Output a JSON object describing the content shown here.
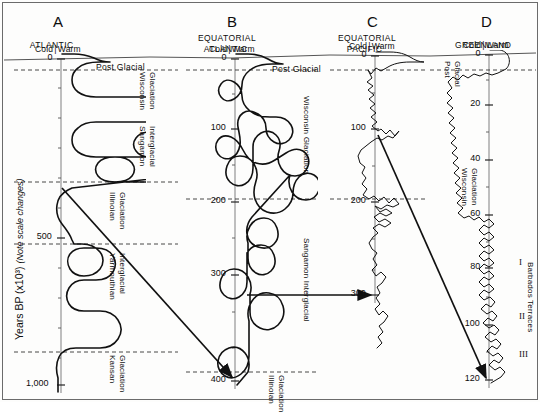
{
  "figure": {
    "y_axis_label_main": "Years BP (x10³)",
    "y_axis_label_note": "(Note scale changes)",
    "cold": "Cold",
    "warm": "Warm",
    "post_glacial": "Post Glacial"
  },
  "panels": [
    {
      "letter": "A",
      "title_lines": [
        "ATLANTIC"
      ],
      "axis_x": 61,
      "ticks": [
        {
          "label": "0",
          "y": 59
        },
        {
          "label": "500",
          "y": 238
        },
        {
          "label": "1,000",
          "y": 385
        }
      ],
      "minor_ticks": [
        88,
        118,
        148,
        178,
        208,
        268,
        298,
        328,
        358
      ],
      "stages": [
        {
          "label_lines": [
            "Wisconsin",
            "Glaciation"
          ],
          "x": 146,
          "y": 72
        },
        {
          "label_lines": [
            "Sangamon",
            "Interglacial"
          ],
          "x": 146,
          "y": 126
        },
        {
          "label_lines": [
            "Illinoian",
            "Glaciation"
          ],
          "x": 116,
          "y": 192
        },
        {
          "label_lines": [
            "Yarmouthian",
            "Interglacial"
          ],
          "x": 116,
          "y": 253
        },
        {
          "label_lines": [
            "Kansan",
            "Glaciation"
          ],
          "x": 116,
          "y": 355
        }
      ],
      "boundaries_y": [
        70,
        182,
        244,
        352
      ]
    },
    {
      "letter": "B",
      "title_lines": [
        "EQUATORIAL",
        "ATLANTIC"
      ],
      "axis_x": 235,
      "ticks": [
        {
          "label": "0",
          "y": 59
        },
        {
          "label": "100",
          "y": 129
        },
        {
          "label": "200",
          "y": 202
        },
        {
          "label": "300",
          "y": 275
        },
        {
          "label": "400",
          "y": 381
        }
      ],
      "minor_ticks": [
        94,
        165,
        238,
        312,
        348
      ],
      "stages": [
        {
          "label_lines": [
            "Wisconsin Glaciation"
          ],
          "x": 310,
          "y": 96
        },
        {
          "label_lines": [
            "Sangamon Interglacial"
          ],
          "x": 310,
          "y": 238
        },
        {
          "label_lines": [
            "Illinoian",
            "Glaciation"
          ],
          "x": 275,
          "y": 375
        }
      ],
      "boundaries_y": [
        70,
        199,
        372
      ]
    },
    {
      "letter": "C",
      "title_lines": [
        "EQUATORIAL",
        "PACIFIC"
      ],
      "axis_x": 375,
      "ticks": [
        {
          "label": "0",
          "y": 56
        },
        {
          "label": "100",
          "y": 129
        },
        {
          "label": "200",
          "y": 202
        },
        {
          "label": "300",
          "y": 295
        }
      ],
      "minor_ticks": [
        93,
        166,
        239,
        270
      ],
      "stages": [],
      "boundaries_y": [
        70,
        199
      ]
    },
    {
      "letter": "D",
      "title_lines": [
        "GREENLAND"
      ],
      "axis_x": 489,
      "ticks": [
        {
          "label": "0",
          "y": 55
        },
        {
          "label": "20",
          "y": 105
        },
        {
          "label": "40",
          "y": 160
        },
        {
          "label": "60",
          "y": 215
        },
        {
          "label": "80",
          "y": 268
        },
        {
          "label": "100",
          "y": 325
        },
        {
          "label": "120",
          "y": 380
        }
      ],
      "minor_ticks": [
        80,
        132,
        187,
        242,
        297,
        352
      ],
      "stages": [
        {
          "label_lines": [
            "Post",
            "Glacial"
          ],
          "x": 451,
          "y": 61
        },
        {
          "label_lines": [
            "Wisconsin",
            "Glaciation"
          ],
          "x": 468,
          "y": 168
        }
      ],
      "boundaries_y": [
        70
      ]
    }
  ],
  "barbados": {
    "label": "Barbados Terraces",
    "terraces": [
      {
        "numeral": "I",
        "x": 519,
        "y": 258
      },
      {
        "numeral": "II",
        "x": 519,
        "y": 312
      },
      {
        "numeral": "III",
        "x": 519,
        "y": 350
      }
    ],
    "label_x": 534,
    "label_y": 262
  },
  "correlation_arrows": [
    {
      "name": "a-to-b",
      "x1": 62,
      "y1": 188,
      "x2": 232,
      "y2": 377
    },
    {
      "name": "b-to-c",
      "x1": 247,
      "y1": 295,
      "x2": 371,
      "y2": 295
    },
    {
      "name": "c-to-d",
      "x1": 378,
      "y1": 135,
      "x2": 486,
      "y2": 378
    }
  ],
  "curves": {
    "A": "M62,54 L74,54 C84,54 89,56 94,58 C100,61 104,62 110,62 L100,62 C88,62 82,64 78,68 C74,71 72,75 72,80 C72,85 74,89 78,92 C82,95 88,97 96,97 L160,97 C168,97 173,99 176,103 C179,107 179,112 176,116 C173,120 168,122 160,122 L96,122 C88,122 82,124 78,128 C74,131 72,135 72,140 C72,145 74,149 78,152 C82,155 88,157 96,157 L150,157 C157,157 161,155 164,151 C167,147 167,142 164,138 C161,134 157,132 150,132 C143,132 139,134 136,138 C133,142 133,147 136,151 C139,155 143,157 150,157 L157,157 C162,157 165,160 167,164 C169,168 169,172 167,176 C164,180 160,182 154,182 L115,182 C107,182 101,180 98,176 C95,172 95,167 98,163 C101,159 107,157 115,157 C123,157 129,159 132,163 C135,167 135,172 132,176 C129,180 123,182 115,182 L154,182 C160,182 164,180 167,177 L72,188 L68,190 C62,193 58,198 57,205 C56,212 58,219 62,224 C66,229 70,234 72,240 L74,244 L82,244 C90,244 96,247 100,252 C104,257 104,264 100,269 C96,274 90,276 84,276 C78,276 73,274 70,269 C67,264 67,258 70,254 C73,250 78,248 84,248 L96,248 C104,248 110,251 113,256 C116,261 116,267 113,272 C110,277 104,280 96,280 L84,280 C77,280 72,283 69,288 C66,293 66,299 69,304 C72,309 77,311 84,311 L100,311 C108,311 114,314 118,320 C122,326 122,333 118,339 C114,345 108,348 100,348 L76,348 C68,348 62,351 59,357 C56,363 56,371 58,378 L58,392",
    "B": "M236,54 L248,54 C258,54 263,56 268,59 C273,62 277,64 283,64 L272,64 C262,64 255,66 250,70 C245,74 242,79 242,85 C242,91 239,96 234,99 C229,102 224,101 221,97 C218,93 218,88 221,84 C224,80 229,79 234,82 C239,85 242,90 242,96 C242,102 245,107 250,111 C255,115 262,117 270,117 L276,117 C283,117 288,120 291,125 C294,130 293,136 289,140 C285,144 279,145 274,142 C269,139 266,134 266,128 C266,122 263,117 258,114 C253,111 247,110 243,113 C239,116 237,121 238,127 C239,133 241,139 240,145 C239,151 236,156 231,158 C226,160 221,158 218,154 C215,150 215,144 218,140 C221,136 226,135 231,137 C236,139 240,144 243,150 C246,156 250,161 256,163 C262,165 269,164 275,160 L286,153 C292,149 298,148 303,151 C308,154 310,160 308,166 C306,172 301,176 295,176 C289,176 284,173 281,168 C278,163 277,157 279,151 C281,145 280,139 276,135 C272,131 266,130 261,133 C256,136 253,141 253,147 L253,168 C253,175 250,181 245,184 C240,187 234,186 230,182 C226,178 225,172 227,166 C229,160 234,156 240,156 C246,156 251,159 254,164 C257,169 258,175 256,181 C254,187 253,193 255,199 C257,205 261,210 267,212 C273,214 280,213 285,209 C290,205 293,199 293,193 C293,187 295,181 299,177 C303,173 309,172 314,175 C319,178 321,184 319,190 C317,196 312,200 306,200 C300,200 295,197 292,192 C289,187 288,181 290,175 L252,217 C248,222 246,228 247,234 C248,240 252,245 258,247 C264,249 270,248 274,244 C278,240 279,234 277,228 C275,222 270,218 264,218 C258,218 253,221 250,226 C247,231 246,237 248,243 L248,258 C248,264 251,270 256,273 C261,276 267,275 271,271 C275,267 276,261 274,255 C272,249 267,245 261,245 C255,245 250,248 247,253 L247,282 C247,288 244,294 239,297 C234,300 228,299 224,295 C220,291 219,285 221,279 C223,273 228,269 234,269 C240,269 245,272 248,277 C251,282 252,288 250,294 L250,312 C250,319 254,325 260,328 C266,331 273,330 278,325 C283,320 285,313 283,306 C281,299 276,294 269,293 C262,292 256,295 252,301 C248,307 247,314 249,321 L249,356 C249,363 246,370 241,374 C236,378 230,379 225,376 C220,373 217,367 218,361 C219,355 223,350 229,348 C235,346 241,348 245,353 C249,358 250,365 248,372 L237,385",
    "C": "M376,52 L390,52 C399,52 405,54 410,57 C415,60 419,62 424,62 L410,62 C400,62 393,64 388,67 L381,71 L376,68 L371,74 L368,70 L372,78 L367,82 L373,86 L368,90 L374,95 L369,99 L375,104 L370,108 L376,113 L371,117 L377,122 L372,126 L378,131 L381,129 L386,134 L390,130 L395,136 L399,131 L393,138 L388,136 L382,140 L377,138 L371,142 L366,146 L361,150 L358,156 L360,163 L365,167 L362,173 L366,178 L362,184 L367,189 L363,195 L369,199 L374,196 L379,201 L384,197 L389,203 L394,198 L399,204 L393,207 L387,205 L381,209 L375,206 L380,212 L386,209 L392,213 L386,216 L380,213 L374,217 L379,222 L385,219 L391,223 L385,227 L379,224 L373,228 L378,233 L373,237 L369,243 L372,249 L377,253 L373,259 L377,265 L372,270 L376,276 L381,272 L386,277 L382,283 L377,287 L380,293 L376,298 L380,304 L375,309 L379,315 L383,311 L388,316 L384,322 L379,326 L383,332 L378,337 L382,343 L377,348",
    "D": "M490,50 L500,50 C505,51 508,54 509,58 C510,62 509,66 506,69 L498,73 L492,75 L486,73 L480,76 L474,74 L468,78 L463,75 L458,80 L453,77 L448,82 L452,88 L447,93 L452,98 L447,103 L453,108 L448,113 L454,118 L449,123 L455,128 L450,133 L456,138 L451,143 L457,148 L452,153 L458,158 L453,163 L459,168 L454,173 L460,178 L455,183 L461,188 L456,193 L462,198 L457,203 L463,208 L458,213 L464,218 L469,216 L474,220 L479,217 L484,222 L489,219 L494,224 L489,228 L484,225 L479,230 L484,235 L489,232 L494,237 L489,241 L484,238 L479,243 L484,248 L489,245 L494,250 L489,254 L484,251 L479,256 L484,261 L489,258 L494,263 L489,267 L484,264 L479,269 L484,274 L489,271 L494,276 L489,280 L484,277 L479,282 L484,287 L489,284 L494,289 L489,293 L484,290 L479,295 L484,300 L490,297 L495,302 L491,307 L486,304 L481,309 L487,314 L492,311 L497,316 L493,321 L488,318 L483,323 L489,328 L494,325 L499,330 L495,335 L490,332 L485,337 L491,342 L496,339 L501,344 L497,349 L492,346 L487,351 L493,356 L498,353 L503,358 L499,363 L494,360 L489,365 L495,370 L500,367 L505,372 L501,377 L496,380 L491,383"
  }
}
